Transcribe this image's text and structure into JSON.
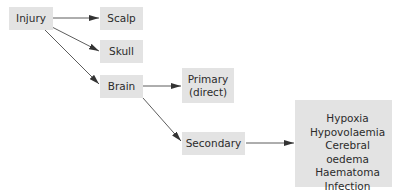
{
  "diagram": {
    "nodes": {
      "injury": "Injury",
      "scalp": "Scalp",
      "skull": "Skull",
      "brain": "Brain",
      "primary_line1": "Primary",
      "primary_line2": "(direct)",
      "secondary": "Secondary"
    },
    "secondary_causes": [
      "Hypoxia",
      "Hypovolaemia",
      "Cerebral oedema",
      "Haematoma",
      "Infection"
    ],
    "edges": [
      {
        "from": "Injury",
        "to": "Scalp"
      },
      {
        "from": "Injury",
        "to": "Skull"
      },
      {
        "from": "Injury",
        "to": "Brain"
      },
      {
        "from": "Brain",
        "to": "Primary (direct)"
      },
      {
        "from": "Brain",
        "to": "Secondary"
      },
      {
        "from": "Secondary",
        "to": "Secondary causes list"
      }
    ],
    "colors": {
      "box_fill": "#e3e3e3",
      "line": "#333333",
      "text": "#2b2b2b"
    }
  }
}
